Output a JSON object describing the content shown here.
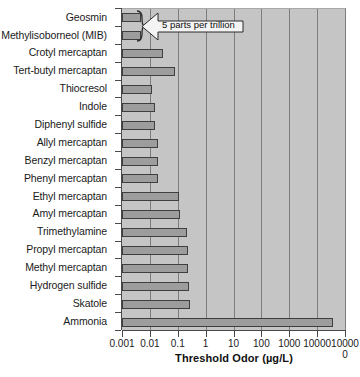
{
  "chart": {
    "type": "bar",
    "orientation": "horizontal",
    "title": "",
    "xlabel": "Threshold Odor (µg/L)",
    "ylabel": "",
    "xscale": "log",
    "xlim": [
      0.001,
      100000
    ],
    "grid": "vertical",
    "legend": "none",
    "bar_color": "#9d9d9d",
    "bar_edge_color": "#3f3f3f",
    "plot_background": "#c5c5c5",
    "gridline_color": "#7d7d7d"
  },
  "chart_data": {
    "type": "bar",
    "title": "",
    "xlabel": "Threshold Odor (µg/L)",
    "ylabel": "",
    "xscale": "log",
    "xlim": [
      0.001,
      100000
    ],
    "grid": true,
    "legend_position": "none",
    "categories": [
      "Geosmin",
      "Methylisoborneol (MIB)",
      "Crotyl mercaptan",
      "Tert-butyl mercaptan",
      "Thiocresol",
      "Indole",
      "Diphenyl sulfide",
      "Allyl mercaptan",
      "Benzyl mercaptan",
      "Phenyl mercaptan",
      "Ethyl mercaptan",
      "Amyl mercaptan",
      "Trimethylamine",
      "Propyl mercaptan",
      "Methyl mercaptan",
      "Hydrogen sulfide",
      "Skatole",
      "Ammonia"
    ],
    "values": [
      0.005,
      0.005,
      0.029,
      0.08,
      0.012,
      0.015,
      0.015,
      0.02,
      0.019,
      0.019,
      0.11,
      0.12,
      0.21,
      0.24,
      0.24,
      0.25,
      0.28,
      37000
    ],
    "xticks": [
      0.001,
      0.01,
      0.1,
      1,
      10,
      100,
      1000,
      10000,
      100000
    ],
    "xticklabels": [
      "0.001",
      "0.01",
      "0.1",
      "1",
      "10",
      "100",
      "1000",
      "10000",
      "100000"
    ],
    "annotations": [
      {
        "text": "5 parts per trillion",
        "points_to": [
          "Geosmin",
          "Methylisoborneol (MIB)"
        ],
        "shape": "left-pointing-arrow-callout"
      }
    ]
  },
  "callout": {
    "text": "5 parts per trillion"
  },
  "axis": {
    "x_title": "Threshold Odor (µg/L)"
  }
}
